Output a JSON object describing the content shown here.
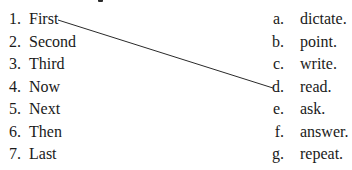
{
  "exercise": {
    "left_items": [
      {
        "number": "1.",
        "word": "First"
      },
      {
        "number": "2.",
        "word": "Second"
      },
      {
        "number": "3.",
        "word": "Third"
      },
      {
        "number": "4.",
        "word": "Now"
      },
      {
        "number": "5.",
        "word": "Next"
      },
      {
        "number": "6.",
        "word": "Then"
      },
      {
        "number": "7.",
        "word": "Last"
      }
    ],
    "right_items": [
      {
        "letter": "a.",
        "word": "dictate."
      },
      {
        "letter": "b.",
        "word": "point."
      },
      {
        "letter": "c.",
        "word": "write."
      },
      {
        "letter": "d.",
        "word": "read."
      },
      {
        "letter": "e.",
        "word": "ask."
      },
      {
        "letter": "f.",
        "word": "answer."
      },
      {
        "letter": "g.",
        "word": "repeat."
      }
    ],
    "matches": [
      {
        "from": "1.",
        "to": "d."
      }
    ],
    "line_color": "#2a2a2a"
  }
}
